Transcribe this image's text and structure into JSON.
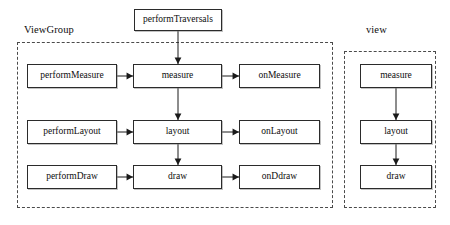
{
  "diagram": {
    "title_text_present": false,
    "groups": [
      {
        "id": "viewgroup",
        "label": "ViewGroup",
        "label_x": 24,
        "label_y": 24,
        "frame": {
          "x": 17,
          "y": 42,
          "w": 316,
          "h": 166
        }
      },
      {
        "id": "view",
        "label": "view",
        "label_x": 366,
        "label_y": 24,
        "frame": {
          "x": 344,
          "y": 51,
          "w": 92,
          "h": 157
        }
      }
    ],
    "nodes": [
      {
        "id": "performTraversals",
        "label": "performTraversals",
        "x": 134,
        "y": 9,
        "w": 88,
        "h": 22
      },
      {
        "id": "performMeasure",
        "label": "performMeasure",
        "x": 27,
        "y": 64,
        "w": 90,
        "h": 24
      },
      {
        "id": "measure",
        "label": "measure",
        "x": 133,
        "y": 64,
        "w": 89,
        "h": 24
      },
      {
        "id": "onMeasure",
        "label": "onMeasure",
        "x": 239,
        "y": 64,
        "w": 81,
        "h": 24
      },
      {
        "id": "performLayout",
        "label": "performLayout",
        "x": 27,
        "y": 120,
        "w": 90,
        "h": 24
      },
      {
        "id": "layout",
        "label": "layout",
        "x": 133,
        "y": 120,
        "w": 89,
        "h": 24
      },
      {
        "id": "onLayout",
        "label": "onLayout",
        "x": 239,
        "y": 120,
        "w": 81,
        "h": 24
      },
      {
        "id": "performDraw",
        "label": "performDraw",
        "x": 27,
        "y": 165,
        "w": 90,
        "h": 24
      },
      {
        "id": "draw",
        "label": "draw",
        "x": 133,
        "y": 165,
        "w": 89,
        "h": 24
      },
      {
        "id": "onDdraw",
        "label": "onDdraw",
        "x": 239,
        "y": 165,
        "w": 81,
        "h": 24
      },
      {
        "id": "view-measure",
        "label": "measure",
        "x": 360,
        "y": 64,
        "w": 72,
        "h": 24
      },
      {
        "id": "view-layout",
        "label": "layout",
        "x": 360,
        "y": 120,
        "w": 72,
        "h": 24
      },
      {
        "id": "view-draw",
        "label": "draw",
        "x": 360,
        "y": 165,
        "w": 72,
        "h": 24
      }
    ],
    "edges": [
      {
        "id": "traversals-to-measure",
        "from": "performTraversals",
        "to": "measure",
        "direction": "down",
        "x1": 178,
        "y1": 31,
        "x2": 178,
        "y2": 64
      },
      {
        "id": "performMeasure-to-measure",
        "from": "performMeasure",
        "to": "measure",
        "direction": "right",
        "x1": 117,
        "y1": 76,
        "x2": 133,
        "y2": 76
      },
      {
        "id": "measure-to-onMeasure",
        "from": "measure",
        "to": "onMeasure",
        "direction": "right",
        "x1": 222,
        "y1": 76,
        "x2": 239,
        "y2": 76
      },
      {
        "id": "measure-to-layout",
        "from": "measure",
        "to": "layout",
        "direction": "down",
        "x1": 178,
        "y1": 88,
        "x2": 178,
        "y2": 120
      },
      {
        "id": "performLayout-to-layout",
        "from": "performLayout",
        "to": "layout",
        "direction": "right",
        "x1": 117,
        "y1": 132,
        "x2": 133,
        "y2": 132
      },
      {
        "id": "layout-to-onLayout",
        "from": "layout",
        "to": "onLayout",
        "direction": "right",
        "x1": 222,
        "y1": 132,
        "x2": 239,
        "y2": 132
      },
      {
        "id": "layout-to-draw",
        "from": "layout",
        "to": "draw",
        "direction": "down",
        "x1": 178,
        "y1": 144,
        "x2": 178,
        "y2": 165
      },
      {
        "id": "performDraw-to-draw",
        "from": "performDraw",
        "to": "draw",
        "direction": "right",
        "x1": 117,
        "y1": 177,
        "x2": 133,
        "y2": 177
      },
      {
        "id": "draw-to-onDdraw",
        "from": "draw",
        "to": "onDdraw",
        "direction": "right",
        "x1": 222,
        "y1": 177,
        "x2": 239,
        "y2": 177
      },
      {
        "id": "view-measure-to-layout",
        "from": "view-measure",
        "to": "view-layout",
        "direction": "down",
        "x1": 396,
        "y1": 88,
        "x2": 396,
        "y2": 120
      },
      {
        "id": "view-layout-to-draw",
        "from": "view-layout",
        "to": "view-draw",
        "direction": "down",
        "x1": 396,
        "y1": 144,
        "x2": 396,
        "y2": 165
      }
    ],
    "colors": {
      "background": "#ffffff",
      "node_border": "#2b2b2b",
      "node_fill": "#ffffff",
      "group_border": "#4a4a4a",
      "text": "#0d0d0d",
      "edge": "#1a1a1a"
    }
  }
}
